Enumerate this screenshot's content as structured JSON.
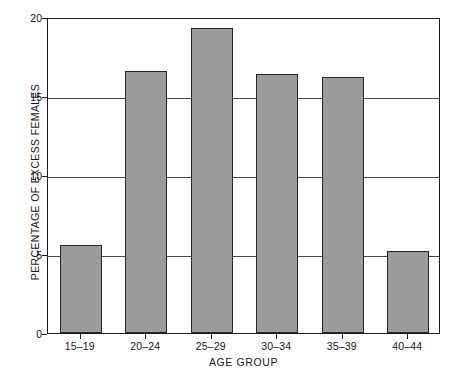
{
  "chart_data": {
    "type": "bar",
    "title": "",
    "xlabel": "AGE GROUP",
    "ylabel": "PERCENTAGE OF EXCESS FEMALES",
    "categories": [
      "15–19",
      "20–24",
      "25–29",
      "30–34",
      "35–39",
      "40–44"
    ],
    "values": [
      5.6,
      16.6,
      19.3,
      16.4,
      16.2,
      5.2
    ],
    "ylim": [
      0,
      20
    ],
    "yticks": [
      0,
      5,
      10,
      15,
      20
    ],
    "ytick_labels": [
      "0",
      "5",
      "10",
      "15",
      "20"
    ],
    "grid": true,
    "grid_axis": "y",
    "legend": false,
    "bar_color": "#9b9b9b",
    "bar_edge_color": "#262626",
    "axis_color": "#1b1b1b",
    "background": "#ffffff"
  },
  "axes": {
    "y_title": "PERCENTAGE OF EXCESS FEMALES",
    "x_title": "AGE GROUP"
  }
}
